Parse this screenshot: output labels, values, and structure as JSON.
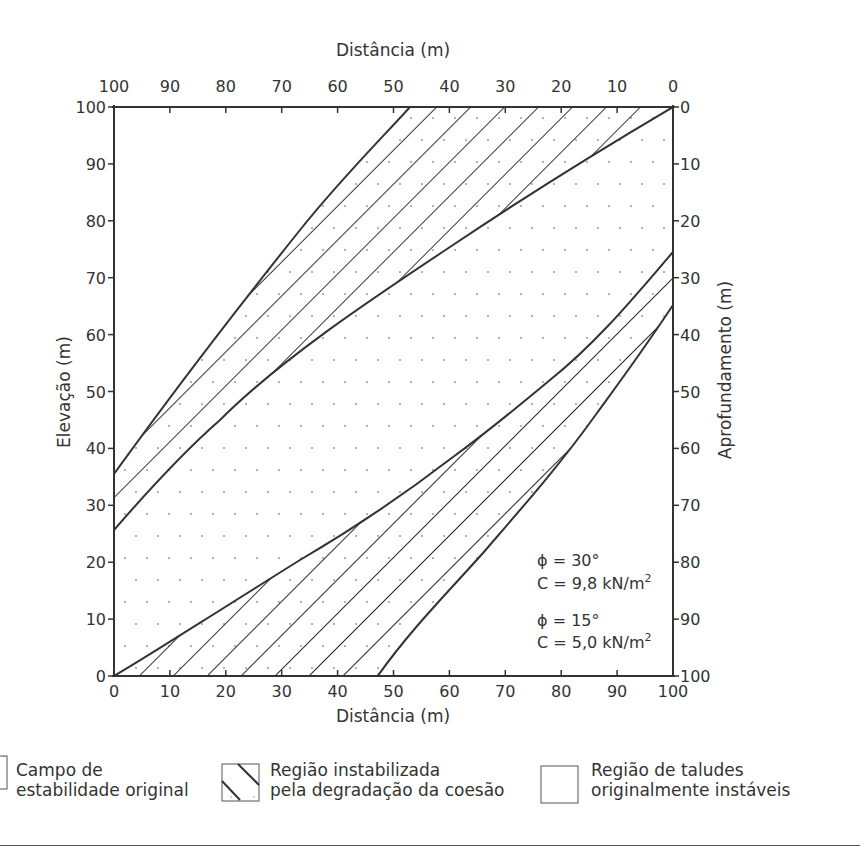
{
  "chart_data": {
    "type": "area",
    "title": "",
    "top_xlabel": "Distância (m)",
    "bottom_xlabel": "Distância (m)",
    "left_ylabel": "Elevação (m)",
    "right_ylabel": "Aprofundamento (m)",
    "bottom_xticks": [
      0,
      10,
      20,
      30,
      40,
      50,
      60,
      70,
      80,
      90,
      100
    ],
    "top_xticks": [
      100,
      90,
      80,
      70,
      60,
      50,
      40,
      30,
      20,
      10,
      0
    ],
    "left_yticks": [
      0,
      10,
      20,
      30,
      40,
      50,
      60,
      70,
      80,
      90,
      100
    ],
    "right_yticks": [
      0,
      10,
      20,
      30,
      40,
      50,
      60,
      70,
      80,
      90,
      100
    ],
    "xlim": [
      0,
      100
    ],
    "ylim": [
      0,
      100
    ],
    "grid": false,
    "series": [
      {
        "name": "Limite superior, φ = 15°, C = 5,0 kN/m²",
        "x": [
          0,
          15.4,
          33.3,
          53
        ],
        "y": [
          35.5,
          57.2,
          78.2,
          100
        ]
      },
      {
        "name": "Limite superior, φ = 30°, C = 9,8 kN/m²",
        "x": [
          0,
          19,
          60.1,
          100
        ],
        "y": [
          25.7,
          45,
          75.3,
          100
        ]
      },
      {
        "name": "Limite inferior, φ = 30°, C = 9,8 kN/m²",
        "x": [
          0,
          11.8,
          27.4,
          38.6,
          60.5,
          78,
          100
        ],
        "y": [
          0,
          7.2,
          23.8,
          39.2,
          38.2,
          51.7,
          74.4
        ]
      },
      {
        "name": "Limite inferior, φ = 15°, C = 5,0 kN/m²",
        "x": [
          47,
          66,
          86.4,
          100
        ],
        "y": [
          0,
          21.7,
          46.2,
          65.1
        ]
      }
    ],
    "annotations": [
      {
        "text": "ϕ = 30°",
        "x": 76,
        "y": 21
      },
      {
        "text": "C = 9,8 kN/m²",
        "x": 76,
        "y": 17
      },
      {
        "text": "ϕ = 15°",
        "x": 76,
        "y": 12.5
      },
      {
        "text": "C = 5,0 kN/m²",
        "x": 76,
        "y": 8.5
      }
    ],
    "legend": [
      {
        "label_line1": "Campo de",
        "label_line2": "estabilidade original",
        "pattern": "dots"
      },
      {
        "label_line1": "Região instabilizada",
        "label_line2": "pela degradação da coesão",
        "pattern": "hatch"
      },
      {
        "label_line1": "Região de taludes",
        "label_line2": "originalmente instáveis",
        "pattern": "blank"
      }
    ],
    "legend_position": "bottom"
  },
  "labels": {
    "top_xlabel": "Distância (m)",
    "bottom_xlabel": "Distância (m)",
    "left_ylabel": "Elevação (m)",
    "right_ylabel": "Aprofundamento (m)",
    "ann1": "ϕ = 30°",
    "ann2a": "C = 9,8 kN/m",
    "ann2sup": "2",
    "ann3": "ϕ = 15°",
    "ann4a": "C = 5,0 kN/m",
    "ann4sup": "2"
  },
  "legend": {
    "item1": {
      "line1": "Campo de",
      "line2": "estabilidade original"
    },
    "item2": {
      "line1": "Região instabilizada",
      "line2": "pela degradação da coesão"
    },
    "item3": {
      "line1": "Região de taludes",
      "line2": "originalmente instáveis"
    }
  },
  "colors": {
    "ink": "#333333",
    "background": "#ffffff",
    "dot": "#9a9a9a"
  }
}
